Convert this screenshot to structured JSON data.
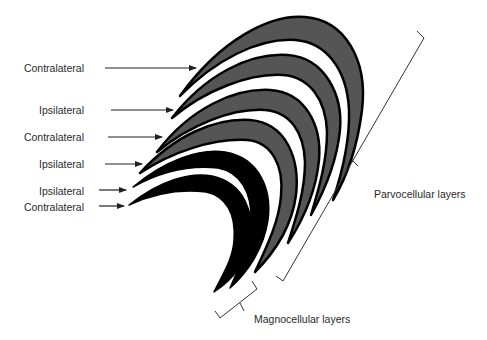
{
  "colors": {
    "parvo_fill": "#555555",
    "magno_fill": "#000000",
    "outline": "#000000",
    "text": "#2a2a2a",
    "line": "#333333"
  },
  "layer_inputs": [
    {
      "label": "Contralateral",
      "layer": 6,
      "type": "parvocellular"
    },
    {
      "label": "Ipsilateral",
      "layer": 5,
      "type": "parvocellular"
    },
    {
      "label": "Contralateral",
      "layer": 4,
      "type": "parvocellular"
    },
    {
      "label": "Ipsilateral",
      "layer": 3,
      "type": "parvocellular"
    },
    {
      "label": "Ipsilateral",
      "layer": 2,
      "type": "magnocellular"
    },
    {
      "label": "Contralateral",
      "layer": 1,
      "type": "magnocellular"
    }
  ],
  "groups": {
    "parvo_label": "Parvocellular layers",
    "magno_label": "Magnocellular layers"
  }
}
